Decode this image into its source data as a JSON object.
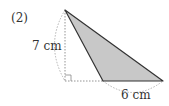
{
  "problem": {
    "number": "(2)",
    "height_label": "7 cm",
    "base_label": "6 cm"
  },
  "figure": {
    "shape": "obtuse triangle with external height",
    "apex": [
      65,
      10
    ],
    "base_left": [
      103,
      81
    ],
    "base_right": [
      163,
      81
    ],
    "foot_of_height": [
      65,
      81
    ],
    "fill_color": "#c8c8c8",
    "stroke_color": "#333333",
    "dashed_color": "#999999",
    "right_angle_marker": true
  }
}
